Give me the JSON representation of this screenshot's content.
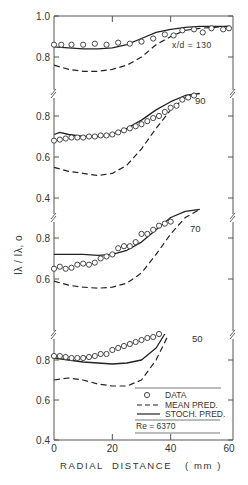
{
  "chart_data": {
    "type": "line",
    "title": "",
    "xlabel": "RADIAL DISTANCE (mm)",
    "ylabel": "I_λ / I_λ,0",
    "xlim": [
      0,
      60
    ],
    "x_ticks": [
      0,
      20,
      40,
      60
    ],
    "grid": false,
    "legend": {
      "position": "lower right",
      "entries": [
        {
          "marker": "circle",
          "label": "DATA"
        },
        {
          "style": "dashed",
          "label": "MEAN PRED."
        },
        {
          "style": "solid",
          "label": "STOCH. PRED."
        }
      ],
      "note": "Re = 6370"
    },
    "panels": [
      {
        "label": "x/d = 130",
        "y_ticks": [
          0.8,
          1.0
        ],
        "data": {
          "x": [
            0,
            2.5,
            6,
            10,
            14,
            18,
            22,
            26,
            30,
            34,
            38,
            41,
            44,
            48,
            51,
            54,
            58,
            60
          ],
          "y": [
            0.86,
            0.86,
            0.86,
            0.86,
            0.865,
            0.86,
            0.87,
            0.865,
            0.875,
            0.89,
            0.91,
            0.905,
            0.93,
            0.935,
            0.92,
            0.94,
            0.935,
            0.94
          ]
        },
        "stoch_pred": {
          "x": [
            0,
            5,
            10,
            15,
            20,
            25,
            30,
            35,
            40,
            45,
            50,
            55,
            60
          ],
          "y": [
            0.85,
            0.845,
            0.84,
            0.84,
            0.845,
            0.86,
            0.89,
            0.92,
            0.935,
            0.945,
            0.95,
            0.95,
            0.95
          ]
        },
        "mean_pred": {
          "x": [
            0,
            5,
            10,
            15,
            20,
            25,
            30,
            35,
            40,
            45,
            50,
            55,
            60
          ],
          "y": [
            0.76,
            0.74,
            0.73,
            0.73,
            0.74,
            0.76,
            0.8,
            0.86,
            0.9,
            0.93,
            0.94,
            0.945,
            0.95
          ]
        }
      },
      {
        "label": "90",
        "y_ticks": [
          0.4,
          0.6,
          0.8
        ],
        "data": {
          "x": [
            0,
            2,
            4,
            6,
            8,
            10,
            12,
            14,
            16,
            18,
            20,
            22,
            24,
            26,
            28,
            30,
            32,
            34,
            36,
            38,
            40,
            42,
            44,
            46,
            48
          ],
          "y": [
            0.68,
            0.685,
            0.69,
            0.695,
            0.695,
            0.695,
            0.7,
            0.7,
            0.705,
            0.705,
            0.71,
            0.72,
            0.73,
            0.74,
            0.75,
            0.76,
            0.775,
            0.79,
            0.8,
            0.82,
            0.84,
            0.85,
            0.88,
            0.89,
            0.9
          ]
        },
        "stoch_pred": {
          "x": [
            0,
            2,
            5,
            10,
            15,
            20,
            25,
            30,
            35,
            40,
            45,
            50
          ],
          "y": [
            0.71,
            0.72,
            0.71,
            0.7,
            0.7,
            0.71,
            0.74,
            0.78,
            0.83,
            0.87,
            0.9,
            0.91
          ]
        },
        "mean_pred": {
          "x": [
            0,
            5,
            10,
            15,
            20,
            25,
            30,
            35,
            40,
            45,
            50
          ],
          "y": [
            0.55,
            0.53,
            0.52,
            0.51,
            0.52,
            0.56,
            0.64,
            0.74,
            0.83,
            0.89,
            0.91
          ]
        }
      },
      {
        "label": "70",
        "y_ticks": [
          0.4,
          0.6,
          0.8
        ],
        "data": {
          "x": [
            0,
            2,
            4,
            6,
            8,
            10,
            12,
            14,
            16,
            18,
            20,
            22,
            24,
            26,
            28,
            30,
            32,
            34,
            36,
            38,
            40
          ],
          "y": [
            0.65,
            0.66,
            0.65,
            0.655,
            0.67,
            0.675,
            0.67,
            0.68,
            0.7,
            0.71,
            0.72,
            0.75,
            0.76,
            0.76,
            0.78,
            0.82,
            0.82,
            0.84,
            0.86,
            0.87,
            0.88
          ]
        },
        "stoch_pred": {
          "x": [
            0,
            5,
            10,
            15,
            20,
            25,
            30,
            35,
            40,
            45,
            50
          ],
          "y": [
            0.72,
            0.72,
            0.72,
            0.715,
            0.72,
            0.74,
            0.78,
            0.84,
            0.9,
            0.93,
            0.94
          ]
        },
        "mean_pred": {
          "x": [
            0,
            5,
            10,
            15,
            20,
            25,
            30,
            35,
            40,
            45,
            50
          ],
          "y": [
            0.59,
            0.57,
            0.56,
            0.555,
            0.56,
            0.58,
            0.63,
            0.72,
            0.82,
            0.9,
            0.94
          ]
        }
      },
      {
        "label": "50",
        "y_ticks": [
          0.4,
          0.6,
          0.8
        ],
        "data": {
          "x": [
            0,
            2,
            4,
            6,
            8,
            10,
            12,
            14,
            16,
            18,
            20,
            22,
            24,
            26,
            28,
            30,
            32,
            34,
            36
          ],
          "y": [
            0.82,
            0.82,
            0.815,
            0.81,
            0.81,
            0.81,
            0.815,
            0.82,
            0.83,
            0.83,
            0.85,
            0.86,
            0.87,
            0.88,
            0.89,
            0.9,
            0.91,
            0.915,
            0.93
          ]
        },
        "stoch_pred": {
          "x": [
            0,
            5,
            10,
            15,
            20,
            25,
            30,
            35,
            38
          ],
          "y": [
            0.81,
            0.8,
            0.79,
            0.785,
            0.78,
            0.785,
            0.8,
            0.86,
            0.93
          ]
        },
        "mean_pred": {
          "x": [
            0,
            5,
            10,
            15,
            20,
            25,
            30,
            35,
            39
          ],
          "y": [
            0.7,
            0.71,
            0.7,
            0.68,
            0.67,
            0.67,
            0.7,
            0.8,
            0.92
          ]
        }
      }
    ]
  },
  "axes": {
    "x_tick_labels": [
      "0",
      "20",
      "40",
      "60"
    ],
    "xlabel": "RADIAL  DISTANCE   ( mm )",
    "ylabel_main": "I",
    "ylabel_text": "Iλ / Iλ, o",
    "y_tick_labels": {
      "p130": [
        "1.0",
        "0.8"
      ],
      "p90": [
        "0.8",
        "0.6",
        "0.4"
      ],
      "p70": [
        "0.8",
        "0.6"
      ],
      "p50": [
        "0.8",
        "0.6",
        "0.4"
      ]
    }
  },
  "legend": {
    "data_label": "DATA",
    "mean_label": "MEAN PRED.",
    "stoch_label": "STOCH. PRED.",
    "re_label": "Re = 6370"
  },
  "panel_labels": {
    "p130": "x/d = 130",
    "p90": "90",
    "p70": "70",
    "p50": "50"
  }
}
